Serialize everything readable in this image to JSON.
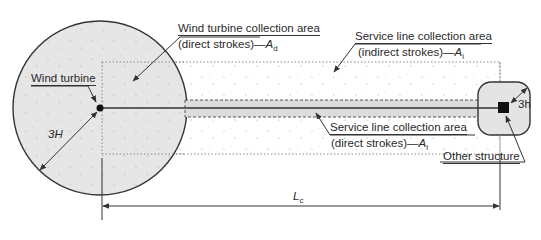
{
  "diagram": {
    "labels": {
      "wind_turbine": "Wind turbine",
      "wt_area_line1": "Wind turbine collection area",
      "wt_area_line2_prefix": "(direct strokes)—",
      "wt_area_symbol": "A",
      "wt_area_subscript": "d",
      "sl_indirect_line1": "Service line collection area",
      "sl_indirect_line2_prefix": "(indirect strokes)—",
      "sl_indirect_symbol": "A",
      "sl_indirect_subscript": "i",
      "sl_direct_line1": "Service line collection area",
      "sl_direct_line2_prefix": "(direct strokes)—",
      "sl_direct_symbol": "A",
      "sl_direct_subscript": "l",
      "other_structure": "Other structure",
      "radius_turbine": "3H",
      "radius_structure": "3h",
      "length_symbol": "L",
      "length_subscript": "c"
    },
    "colors": {
      "fill_gray": "#e4e4e4",
      "outline": "#333333",
      "dots": "#9a9a9a"
    }
  }
}
